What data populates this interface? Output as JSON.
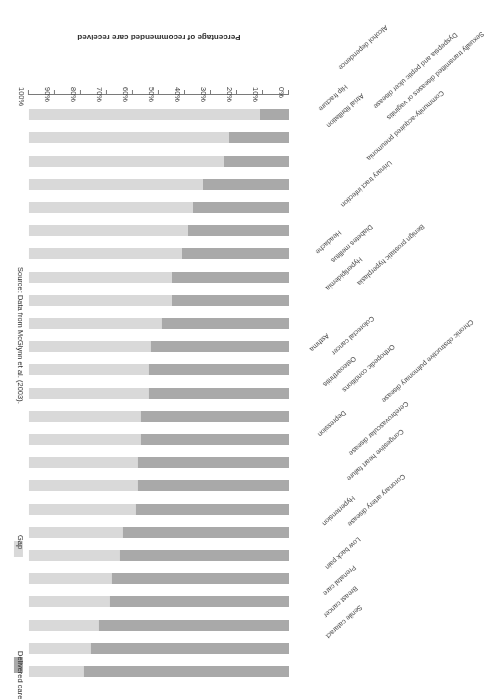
{
  "chart_data": {
    "type": "bar",
    "subtype": "stacked-horizontal-100",
    "title": "",
    "xlabel": "Percentage of recommended care received",
    "ylabel": "",
    "xlim": [
      0,
      100
    ],
    "grid": false,
    "legend_position": "right",
    "tick_labels": [
      "0%",
      "10%",
      "20%",
      "30%",
      "40%",
      "50%",
      "60%",
      "70%",
      "80%",
      "90%",
      "100%"
    ],
    "tick_values": [
      0,
      10,
      20,
      30,
      40,
      50,
      60,
      70,
      80,
      90,
      100
    ],
    "categories": [
      "Senile cataract",
      "Breast cancer",
      "Prenatal care",
      "Low back pain",
      "Coronary artery disease",
      "Hypertension",
      "Congestive heart failure",
      "Cerebrovascular disease",
      "Chronic obstructive pulmonary disease",
      "Depression",
      "Orthopedic conditions",
      "Osteoarthritis",
      "Colorectal cancer",
      "Asthma",
      "Benign prostatic hyperplasia",
      "Hyperlipidemia",
      "Diabetes mellitus",
      "Headache",
      "Urinary tract infection",
      "Community-acquired pneumonia",
      "Sexually transmitted diseases or vaginitis",
      "Dyspepsia and peptic ulcer disease",
      "Atrial fibrillation",
      "Hip fracture",
      "Alcohol dependence"
    ],
    "series": [
      {
        "name": "Delivered care",
        "color": "#a9a9a9",
        "values": [
          79,
          76,
          73,
          69,
          68,
          65,
          64,
          59,
          58,
          58,
          57,
          57,
          54,
          54,
          53,
          49,
          45,
          45,
          41,
          39,
          37,
          33,
          25,
          23,
          11
        ]
      },
      {
        "name": "Gap",
        "color": "#d9d9d9",
        "values": [
          21,
          24,
          27,
          31,
          32,
          35,
          36,
          41,
          42,
          42,
          43,
          43,
          46,
          46,
          47,
          51,
          55,
          55,
          59,
          61,
          63,
          67,
          75,
          77,
          89
        ]
      }
    ],
    "source": "Source: Data from McGlynn et al. (2003)."
  },
  "legend": {
    "items": [
      {
        "label": "Delivered care",
        "color": "#a9a9a9"
      },
      {
        "label": "Gap",
        "color": "#d9d9d9"
      }
    ]
  }
}
